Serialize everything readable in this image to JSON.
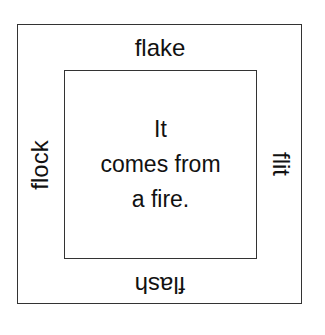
{
  "diagram": {
    "center": {
      "lines": [
        "It",
        "comes from",
        "a fire."
      ]
    },
    "words": {
      "top": "flake",
      "left": "flock",
      "right": "flit",
      "bottom": "flash"
    }
  }
}
